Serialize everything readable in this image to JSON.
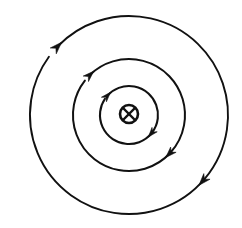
{
  "figure": {
    "background_color": "#ffffff",
    "stroke_color": "#111111",
    "width": 242,
    "height": 228,
    "center": {
      "x": 129,
      "y": 115
    }
  },
  "conductor": {
    "label": "current-into-page-symbol",
    "symbol": "⊗",
    "meaning": "current directed into the page",
    "center": {
      "x": 129,
      "y": 114
    },
    "ring_radius": 9,
    "ring_stroke_width": 2.6,
    "cross_stroke_width": 2.2,
    "fill_color": "#ffffff",
    "stroke_color": "#111111"
  },
  "field_lines": [
    {
      "name": "inner-field-line",
      "index": 1,
      "radius": 29,
      "stroke_width": 2.1,
      "direction": "clockwise",
      "gap_start_deg": 214,
      "gap_end_deg": 222,
      "arrows": [
        {
          "name": "inner-arrow-upper-left",
          "angle_deg": 222,
          "size": 8.5
        },
        {
          "name": "inner-arrow-lower-right",
          "angle_deg": 40,
          "size": 8.5
        }
      ]
    },
    {
      "name": "middle-field-line",
      "index": 2,
      "radius": 56,
      "stroke_width": 2.0,
      "direction": "clockwise",
      "gap_start_deg": 218,
      "gap_end_deg": 226,
      "arrows": [
        {
          "name": "middle-arrow-upper-left",
          "angle_deg": 226,
          "size": 9.5
        },
        {
          "name": "middle-arrow-lower-right",
          "angle_deg": 44,
          "size": 9.5
        }
      ]
    },
    {
      "name": "outer-field-line",
      "index": 3,
      "radius": 99,
      "stroke_width": 1.9,
      "direction": "clockwise",
      "gap_start_deg": 216,
      "gap_end_deg": 224,
      "arrows": [
        {
          "name": "outer-arrow-upper-left",
          "angle_deg": 224,
          "size": 10.5
        },
        {
          "name": "outer-arrow-lower-right",
          "angle_deg": 42,
          "size": 10.5
        }
      ]
    }
  ]
}
